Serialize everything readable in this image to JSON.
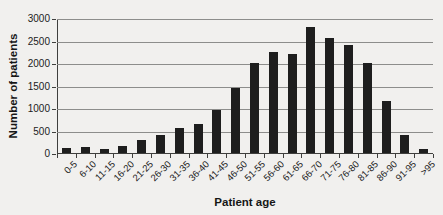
{
  "figure": {
    "background_color": "#f1f0ee",
    "bar_color": "#1e1e1e",
    "gridline_color": "#8d8d8b",
    "axis_color": "#3f3f3d",
    "text_color": "#1c1c1c"
  },
  "chart_data": {
    "type": "bar",
    "title": "",
    "xlabel": "Patient age",
    "ylabel": "Number of patients",
    "categories": [
      "0-5",
      "6-10",
      "11-15",
      "16-20",
      "21-25",
      "26-30",
      "31-35",
      "36-40",
      "41-45",
      "46-50",
      "51-55",
      "56-60",
      "61-65",
      "66-70",
      "71-75",
      "76-80",
      "81-85",
      "86-90",
      "91-95",
      ">95"
    ],
    "values": [
      120,
      130,
      100,
      160,
      290,
      410,
      550,
      650,
      950,
      1450,
      2000,
      2250,
      2200,
      2800,
      2550,
      2400,
      2000,
      1150,
      400,
      80
    ],
    "ylim": [
      0,
      3000
    ],
    "y_ticks": [
      0,
      500,
      1000,
      1500,
      2000,
      2500,
      3000
    ],
    "grid": "horizontal",
    "legend": "none"
  }
}
